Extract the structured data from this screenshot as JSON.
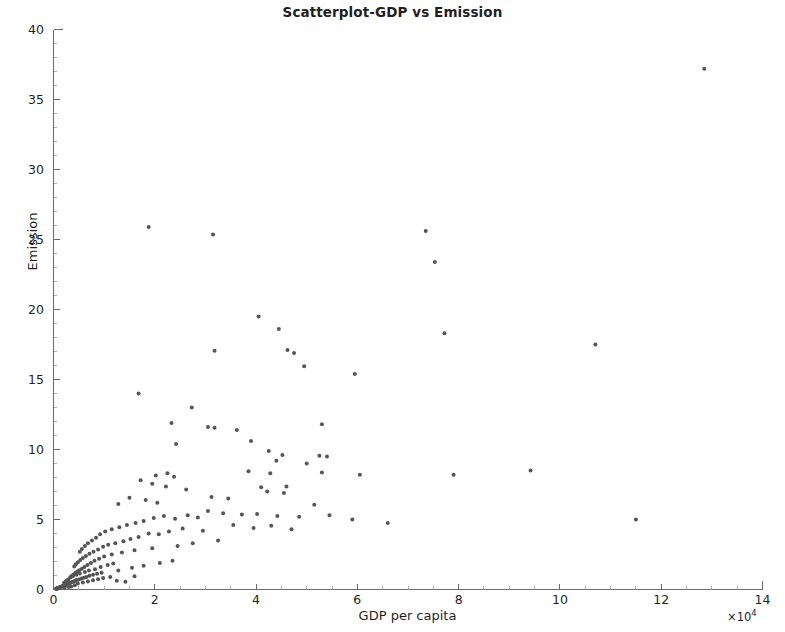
{
  "chart_data": {
    "type": "scatter",
    "title": "Scatterplot-GDP vs Emission",
    "xlabel": "GDP per capita",
    "ylabel": "Emission",
    "x_exponent_label": "×10⁴",
    "x_exponent_value": 10000,
    "xlim": [
      0,
      14
    ],
    "ylim": [
      0,
      40
    ],
    "xticks": [
      0,
      2,
      4,
      6,
      8,
      10,
      12,
      14
    ],
    "yticks": [
      0,
      5,
      10,
      15,
      20,
      25,
      30,
      35,
      40
    ],
    "xtick_labels": [
      "0",
      "2",
      "4",
      "6",
      "8",
      "10",
      "12",
      "14"
    ],
    "ytick_labels": [
      "0",
      "5",
      "10",
      "15",
      "20",
      "25",
      "30",
      "35",
      "40"
    ],
    "grid": false,
    "legend": null,
    "marker": {
      "shape": "circle",
      "size_px": 4,
      "color": "#555555"
    },
    "axis_color": "#6b6b6b",
    "background_color": "#ffffff",
    "n_points": 196,
    "note_x_units": "x values are in units of 10^4 (matching the ×10⁴ axis multiplier)",
    "points": [
      [
        12.85,
        37.2
      ],
      [
        1.88,
        25.9
      ],
      [
        3.15,
        25.35
      ],
      [
        7.35,
        25.6
      ],
      [
        7.53,
        23.4
      ],
      [
        4.05,
        19.5
      ],
      [
        4.45,
        18.6
      ],
      [
        7.72,
        18.3
      ],
      [
        10.7,
        17.5
      ],
      [
        3.18,
        17.05
      ],
      [
        4.62,
        17.1
      ],
      [
        4.75,
        16.9
      ],
      [
        4.95,
        15.95
      ],
      [
        5.95,
        15.4
      ],
      [
        1.68,
        14.0
      ],
      [
        2.73,
        13.0
      ],
      [
        2.33,
        11.9
      ],
      [
        3.05,
        11.6
      ],
      [
        3.18,
        11.55
      ],
      [
        3.62,
        11.4
      ],
      [
        5.3,
        11.8
      ],
      [
        2.42,
        10.4
      ],
      [
        3.9,
        10.6
      ],
      [
        4.25,
        9.9
      ],
      [
        4.52,
        9.6
      ],
      [
        5.25,
        9.55
      ],
      [
        5.4,
        9.5
      ],
      [
        4.4,
        9.2
      ],
      [
        5.0,
        9.0
      ],
      [
        3.85,
        8.45
      ],
      [
        4.28,
        8.3
      ],
      [
        5.3,
        8.35
      ],
      [
        6.05,
        8.2
      ],
      [
        9.42,
        8.5
      ],
      [
        7.9,
        8.2
      ],
      [
        2.02,
        8.15
      ],
      [
        2.25,
        8.3
      ],
      [
        2.38,
        8.05
      ],
      [
        1.72,
        7.8
      ],
      [
        1.95,
        7.55
      ],
      [
        2.22,
        7.35
      ],
      [
        4.1,
        7.3
      ],
      [
        4.6,
        7.35
      ],
      [
        4.22,
        7.0
      ],
      [
        2.62,
        7.15
      ],
      [
        1.5,
        6.55
      ],
      [
        1.82,
        6.4
      ],
      [
        2.05,
        6.2
      ],
      [
        1.28,
        6.1
      ],
      [
        3.12,
        6.6
      ],
      [
        3.45,
        6.5
      ],
      [
        4.55,
        6.9
      ],
      [
        5.15,
        6.05
      ],
      [
        11.5,
        5.0
      ],
      [
        6.6,
        4.75
      ],
      [
        5.9,
        5.0
      ],
      [
        5.45,
        5.3
      ],
      [
        4.85,
        5.2
      ],
      [
        4.42,
        5.25
      ],
      [
        4.02,
        5.4
      ],
      [
        3.72,
        5.35
      ],
      [
        3.35,
        5.45
      ],
      [
        3.05,
        5.6
      ],
      [
        2.85,
        5.15
      ],
      [
        2.65,
        5.3
      ],
      [
        2.4,
        5.05
      ],
      [
        2.18,
        5.25
      ],
      [
        1.98,
        5.1
      ],
      [
        1.78,
        4.9
      ],
      [
        1.62,
        4.75
      ],
      [
        1.45,
        4.6
      ],
      [
        1.3,
        4.45
      ],
      [
        1.15,
        4.3
      ],
      [
        1.02,
        4.15
      ],
      [
        0.92,
        3.95
      ],
      [
        0.84,
        3.7
      ],
      [
        0.76,
        3.5
      ],
      [
        0.68,
        3.3
      ],
      [
        0.62,
        3.1
      ],
      [
        0.56,
        2.9
      ],
      [
        0.52,
        2.7
      ],
      [
        3.55,
        4.6
      ],
      [
        3.95,
        4.4
      ],
      [
        4.3,
        4.55
      ],
      [
        4.7,
        4.3
      ],
      [
        2.95,
        4.2
      ],
      [
        2.55,
        4.35
      ],
      [
        2.28,
        4.15
      ],
      [
        2.08,
        3.95
      ],
      [
        1.88,
        4.0
      ],
      [
        1.68,
        3.75
      ],
      [
        1.52,
        3.6
      ],
      [
        1.38,
        3.45
      ],
      [
        1.22,
        3.3
      ],
      [
        1.08,
        3.2
      ],
      [
        0.98,
        3.05
      ],
      [
        0.88,
        2.85
      ],
      [
        0.79,
        2.7
      ],
      [
        0.71,
        2.55
      ],
      [
        0.64,
        2.4
      ],
      [
        0.58,
        2.25
      ],
      [
        0.53,
        2.1
      ],
      [
        0.48,
        1.95
      ],
      [
        0.44,
        1.8
      ],
      [
        0.41,
        1.65
      ],
      [
        2.75,
        3.3
      ],
      [
        3.25,
        3.5
      ],
      [
        2.45,
        3.1
      ],
      [
        1.95,
        2.95
      ],
      [
        1.6,
        2.8
      ],
      [
        1.35,
        2.65
      ],
      [
        1.15,
        2.5
      ],
      [
        1.0,
        2.35
      ],
      [
        0.9,
        2.2
      ],
      [
        0.81,
        2.05
      ],
      [
        0.74,
        1.9
      ],
      [
        0.67,
        1.75
      ],
      [
        0.61,
        1.6
      ],
      [
        0.56,
        1.48
      ],
      [
        0.51,
        1.38
      ],
      [
        0.47,
        1.28
      ],
      [
        0.43,
        1.18
      ],
      [
        0.4,
        1.08
      ],
      [
        0.37,
        1.0
      ],
      [
        0.35,
        0.92
      ],
      [
        1.28,
        1.35
      ],
      [
        1.55,
        1.55
      ],
      [
        1.78,
        1.7
      ],
      [
        2.1,
        1.9
      ],
      [
        2.35,
        2.05
      ],
      [
        0.95,
        1.2
      ],
      [
        0.86,
        1.12
      ],
      [
        0.78,
        1.05
      ],
      [
        0.71,
        0.98
      ],
      [
        0.65,
        0.9
      ],
      [
        0.6,
        0.84
      ],
      [
        0.55,
        0.78
      ],
      [
        0.5,
        0.72
      ],
      [
        0.46,
        0.67
      ],
      [
        0.43,
        0.62
      ],
      [
        0.4,
        0.58
      ],
      [
        0.37,
        0.54
      ],
      [
        0.34,
        0.5
      ],
      [
        0.32,
        0.46
      ],
      [
        0.3,
        0.43
      ],
      [
        0.28,
        0.4
      ],
      [
        0.26,
        0.37
      ],
      [
        0.25,
        0.34
      ],
      [
        0.23,
        0.32
      ],
      [
        0.22,
        0.3
      ],
      [
        0.2,
        0.28
      ],
      [
        0.19,
        0.26
      ],
      [
        0.18,
        0.24
      ],
      [
        0.17,
        0.22
      ],
      [
        0.16,
        0.2
      ],
      [
        0.15,
        0.19
      ],
      [
        0.14,
        0.17
      ],
      [
        0.13,
        0.16
      ],
      [
        0.12,
        0.15
      ],
      [
        0.115,
        0.14
      ],
      [
        0.11,
        0.13
      ],
      [
        0.105,
        0.12
      ],
      [
        0.1,
        0.11
      ],
      [
        0.095,
        0.1
      ],
      [
        0.09,
        0.095
      ],
      [
        0.085,
        0.09
      ],
      [
        0.08,
        0.085
      ],
      [
        0.075,
        0.08
      ],
      [
        0.07,
        0.075
      ],
      [
        0.065,
        0.07
      ],
      [
        0.06,
        0.065
      ],
      [
        0.055,
        0.06
      ],
      [
        0.05,
        0.055
      ],
      [
        0.33,
        0.85
      ],
      [
        0.38,
        0.95
      ],
      [
        0.45,
        1.05
      ],
      [
        0.52,
        1.15
      ],
      [
        0.29,
        0.72
      ],
      [
        0.26,
        0.62
      ],
      [
        0.24,
        0.55
      ],
      [
        0.21,
        0.48
      ],
      [
        0.62,
        1.25
      ],
      [
        0.7,
        1.35
      ],
      [
        0.82,
        1.45
      ],
      [
        0.93,
        1.6
      ],
      [
        1.07,
        1.75
      ],
      [
        1.18,
        1.85
      ],
      [
        0.48,
        0.42
      ],
      [
        0.58,
        0.5
      ],
      [
        0.68,
        0.58
      ],
      [
        0.78,
        0.66
      ],
      [
        0.88,
        0.74
      ],
      [
        0.98,
        0.82
      ],
      [
        1.12,
        0.9
      ],
      [
        1.25,
        0.62
      ],
      [
        1.42,
        0.55
      ],
      [
        1.6,
        0.95
      ],
      [
        0.35,
        0.22
      ],
      [
        0.42,
        0.3
      ],
      [
        0.3,
        0.18
      ],
      [
        0.22,
        0.14
      ]
    ]
  }
}
